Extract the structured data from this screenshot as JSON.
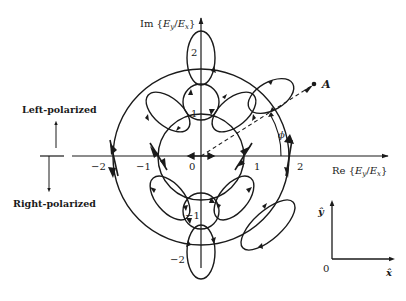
{
  "diagram": {
    "type": "complex-plane polarization map",
    "axes": {
      "x_label_prefix": "Re {",
      "x_label_E1": "E",
      "x_label_sub1": "y",
      "x_label_slash": "/",
      "x_label_E2": "E",
      "x_label_sub2": "x",
      "x_label_suffix": "}",
      "y_label_prefix": "Im {",
      "y_label_suffix": "}",
      "x_ticks": [
        "−2",
        "−1",
        "0",
        "1",
        "2"
      ],
      "y_ticks": [
        "2",
        "1",
        "−1",
        "−2"
      ]
    },
    "point_label": "A",
    "angle_label": "ϕ",
    "legend": {
      "left_polarized": "Left-polarized",
      "right_polarized": "Right-polarized"
    },
    "unit_vectors": {
      "x_hat": "x̂",
      "y_hat": "ŷ",
      "origin": "0"
    },
    "circles": [
      {
        "name": "unit-circle",
        "radius": 1
      },
      {
        "name": "radius-2-circle",
        "radius": 2
      }
    ],
    "colors": {
      "ink": "#1a1a1a",
      "background": "#ffffff"
    }
  }
}
